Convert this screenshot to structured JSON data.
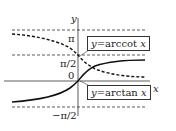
{
  "diagram": {
    "axes": {
      "x_label": "x",
      "y_label": "y",
      "origin_label": "0"
    },
    "y_ticks": {
      "pi": "π",
      "half_pi": "π/2",
      "neg_half_pi": "−π/2"
    },
    "curves": [
      {
        "name": "arccot",
        "label_prefix": "y = ",
        "label_func": "arccot",
        "label_var": "x",
        "style": "dashed"
      },
      {
        "name": "arctan",
        "label_prefix": "y = ",
        "label_func": "arctan",
        "label_var": "x",
        "style": "solid"
      }
    ],
    "asymptotes": [
      "π",
      "π/2",
      "−π/2"
    ]
  }
}
